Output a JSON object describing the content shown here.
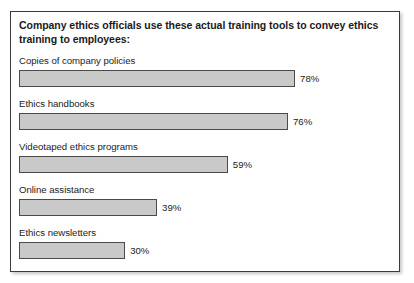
{
  "chart_data": {
    "type": "bar",
    "orientation": "horizontal",
    "title": "Company ethics officials use these actual training tools to convey ethics training to employees:",
    "xlabel": "",
    "ylabel": "",
    "xlim": [
      0,
      100
    ],
    "grid": false,
    "legend": null,
    "value_suffix": "%",
    "categories": [
      "Copies of company policies",
      "Ethics handbooks",
      "Videotaped ethics programs",
      "Online assistance",
      "Ethics newsletters"
    ],
    "values": [
      78,
      76,
      59,
      39,
      30
    ],
    "value_labels": [
      "78%",
      "76%",
      "59%",
      "39%",
      "30%"
    ],
    "bars": [
      {
        "label": "Copies of company policies",
        "value": 78,
        "value_label": "78%"
      },
      {
        "label": "Ethics handbooks",
        "value": 76,
        "value_label": "76%"
      },
      {
        "label": "Videotaped ethics programs",
        "value": 59,
        "value_label": "59%"
      },
      {
        "label": "Online assistance",
        "value": 39,
        "value_label": "39%"
      },
      {
        "label": "Ethics newsletters",
        "value": 30,
        "value_label": "30%"
      }
    ],
    "colors": {
      "bar_fill": "#c9c9c9",
      "bar_border": "#4a4a4a",
      "text": "#1b1b1b",
      "frame_border": "#3b3b3b",
      "background": "#ffffff"
    },
    "scale_px_per_percent": 3.54,
    "bar_origin_px": 7
  }
}
